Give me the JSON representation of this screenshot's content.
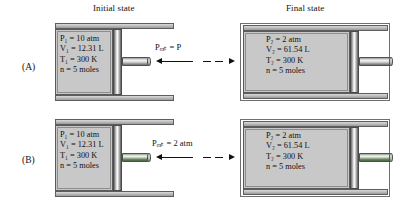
{
  "headers": {
    "initial": "Initial state",
    "final": "Final state"
  },
  "rows": [
    {
      "label": "(A)",
      "initial": {
        "pressure": "P₁ = 10 atm",
        "volume": "V₁ = 12.31 L",
        "temperature": "T₁ = 300 K",
        "moles": "n = 5 moles"
      },
      "external_pressure": "Pₑₓₜ = P",
      "final": {
        "pressure": "P₂ = 2 atm",
        "volume": "V₂ = 61.54 L",
        "temperature": "T₂ = 300 K",
        "moles": "n = 5 moles"
      }
    },
    {
      "label": "(B)",
      "initial": {
        "pressure": "P₁ = 10 atm",
        "volume": "V₁ = 12.31 L",
        "temperature": "T₁ = 300 K",
        "moles": "n = 5 moles"
      },
      "external_pressure": "Pₑₓₜ = 2 atm",
      "final": {
        "pressure": "P₂ = 2 atm",
        "volume": "V₂ = 61.54 L",
        "temperature": "T₂ = 300 K",
        "moles": "n = 5 moles"
      }
    }
  ],
  "colors": {
    "gas_fill": "#c8c8c8",
    "metal_dark": "#5d5d5d",
    "metal_light": "#fbfbfb",
    "outline": "#5a5a5a",
    "arrow": "#111111",
    "seal_green": "#46633f",
    "background": "#ffffff"
  }
}
